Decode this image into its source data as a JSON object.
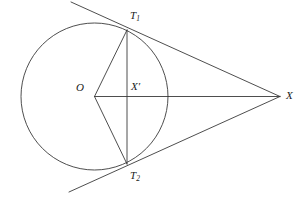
{
  "figure": {
    "type": "euclidean-geometry-diagram",
    "background_color": "#ffffff",
    "stroke_color": "#3a3a3a",
    "label_color": "#1a1a1a"
  },
  "circle": {
    "name": "circle-O",
    "center_x": 94.5,
    "center_y": 96.5,
    "radius": 73.5
  },
  "points": {
    "O": {
      "label": "O",
      "x": 94.5,
      "y": 96.5,
      "label_x": 76,
      "label_y": 82
    },
    "T1": {
      "label": "T",
      "subscript": "1",
      "x": 127,
      "y": 30,
      "label_x": 130,
      "label_y": 10
    },
    "T2": {
      "label": "T",
      "subscript": "2",
      "x": 127,
      "y": 164,
      "label_x": 130,
      "label_y": 170
    },
    "Xprime": {
      "label": "X",
      "prime": "′",
      "x": 127,
      "y": 96.5,
      "label_x": 131,
      "label_y": 81
    },
    "X": {
      "label": "X",
      "x": 280,
      "y": 96.5,
      "label_x": 286,
      "label_y": 90
    }
  },
  "segments": [
    {
      "name": "segment-O-T1",
      "x1": 94.5,
      "y1": 96.5,
      "x2": 127,
      "y2": 30
    },
    {
      "name": "segment-O-T2",
      "x1": 94.5,
      "y1": 96.5,
      "x2": 127,
      "y2": 164
    },
    {
      "name": "segment-O-X",
      "x1": 94.5,
      "y1": 96.5,
      "x2": 280,
      "y2": 96.5
    },
    {
      "name": "chord-T1-T2",
      "x1": 127,
      "y1": 30,
      "x2": 127,
      "y2": 164
    }
  ],
  "tangent_lines": [
    {
      "name": "tangent-line-upper",
      "x1": 71,
      "y1": 2,
      "x2": 280,
      "y2": 96.5,
      "touch_x": 127,
      "touch_y": 30
    },
    {
      "name": "tangent-line-lower",
      "x1": 69,
      "y1": 192,
      "x2": 280,
      "y2": 96.5,
      "touch_x": 127,
      "touch_y": 164
    }
  ]
}
